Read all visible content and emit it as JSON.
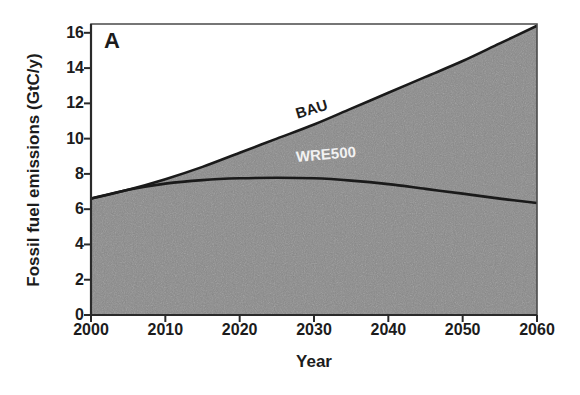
{
  "figure": {
    "panel_letter": "A",
    "background_color": "#ffffff",
    "fill_color": "#8a8a8a",
    "line_color": "#1a1a1a",
    "axis_color": "#4a4a4a"
  },
  "chart_data": {
    "type": "area",
    "title": "",
    "panel": "A",
    "xlabel": "Year",
    "ylabel": "Fossil fuel emissions (GtC/y)",
    "xlim": [
      2000,
      2060
    ],
    "ylim": [
      0,
      16.5
    ],
    "xticks": [
      2000,
      2010,
      2020,
      2030,
      2040,
      2050,
      2060
    ],
    "xtick_labels": [
      "2000",
      "2010",
      "2020",
      "2030",
      "2040",
      "2050",
      "2060"
    ],
    "yticks": [
      0,
      2,
      4,
      6,
      8,
      10,
      12,
      14,
      16
    ],
    "ytick_labels": [
      "0",
      "2",
      "4",
      "6",
      "8",
      "10",
      "12",
      "14",
      "16"
    ],
    "grid": false,
    "legend_position": "inline-annotations",
    "annotations": [
      {
        "text": "BAU",
        "x": 2033,
        "y": 10.6,
        "color": "#1c1c1c"
      },
      {
        "text": "WRE500",
        "x": 2033,
        "y": 8.2,
        "color": "#f2f2f2"
      }
    ],
    "x": [
      2000,
      2005,
      2010,
      2015,
      2020,
      2025,
      2030,
      2035,
      2040,
      2045,
      2050,
      2055,
      2060
    ],
    "series": [
      {
        "name": "BAU",
        "values": [
          6.6,
          7.1,
          7.7,
          8.4,
          9.2,
          10.0,
          10.8,
          11.7,
          12.6,
          13.5,
          14.4,
          15.4,
          16.4
        ],
        "style": "solid",
        "color": "#1a1a1a"
      },
      {
        "name": "WRE500",
        "values": [
          6.6,
          7.1,
          7.45,
          7.65,
          7.75,
          7.78,
          7.75,
          7.62,
          7.42,
          7.15,
          6.88,
          6.6,
          6.35
        ],
        "style": "solid",
        "color": "#1a1a1a"
      }
    ]
  }
}
